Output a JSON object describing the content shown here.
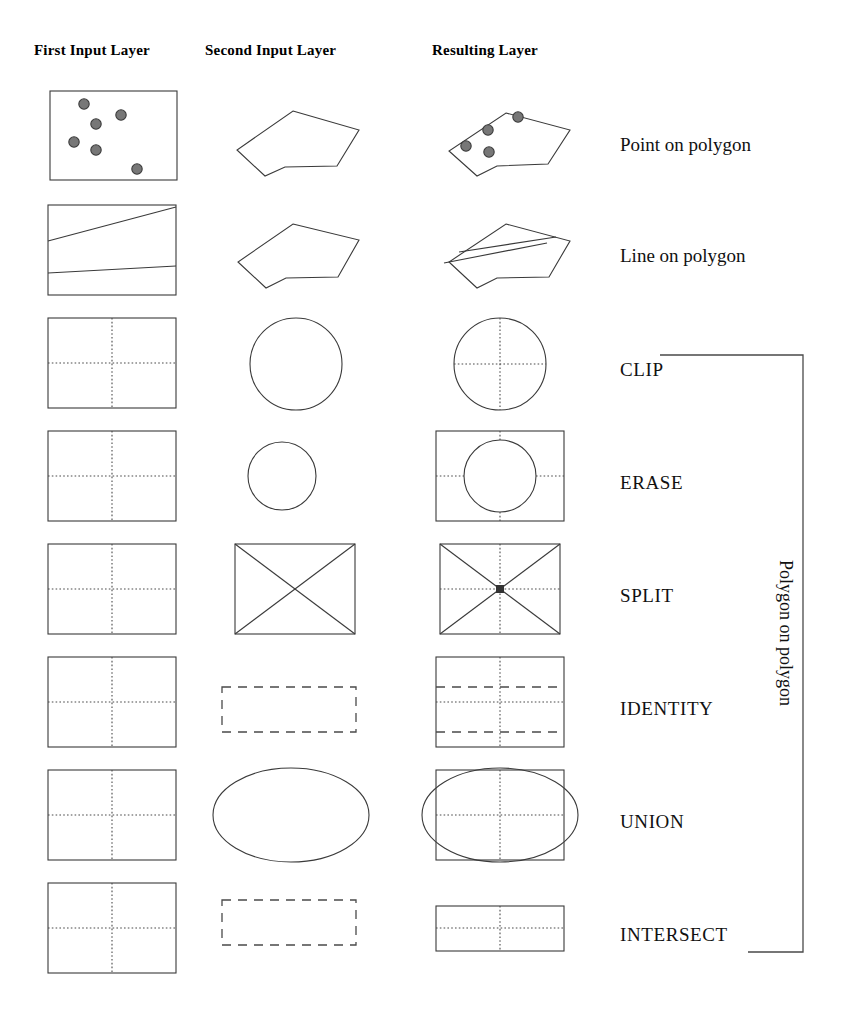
{
  "headers": {
    "first": "First Input Layer",
    "second": "Second Input Layer",
    "result": "Resulting Layer"
  },
  "bracket": {
    "label": "Polygon on polygon",
    "covers_from": "CLIP",
    "covers_to": "INTERSECT"
  },
  "rows": [
    {
      "id": "point-on-polygon",
      "label": "Point on polygon",
      "first": "rectangle with 6 scattered points",
      "second": "irregular polygon",
      "result": "polygon containing 4 points"
    },
    {
      "id": "line-on-polygon",
      "label": "Line on polygon",
      "first": "rectangle with two crossing lines",
      "second": "irregular polygon",
      "result": "polygon with crossing lines clipped to polygon"
    },
    {
      "id": "clip",
      "label": "CLIP",
      "first": "rectangle divided by dotted cross",
      "second": "circle",
      "result": "circle with dotted cross inside"
    },
    {
      "id": "erase",
      "label": "ERASE",
      "first": "rectangle divided by dotted cross",
      "second": "small circle",
      "result": "rectangle with circular hole removed"
    },
    {
      "id": "split",
      "label": "SPLIT",
      "first": "rectangle divided by dotted cross",
      "second": "rectangle with X diagonals",
      "result": "rectangle with dotted cross and X diagonals"
    },
    {
      "id": "identity",
      "label": "IDENTITY",
      "first": "rectangle divided by dotted cross",
      "second": "wide dashed rectangle",
      "result": "rectangle with dotted cross plus dashed band edges"
    },
    {
      "id": "union",
      "label": "UNION",
      "first": "rectangle divided by dotted cross",
      "second": "ellipse",
      "result": "rectangle with dotted cross overlaid by ellipse"
    },
    {
      "id": "intersect",
      "label": "INTERSECT",
      "first": "rectangle divided by dotted cross",
      "second": "wide dashed rectangle",
      "result": "short wide rectangle with dotted cross"
    }
  ],
  "colors": {
    "stroke": "#3a3a3a",
    "dotted": "#4a4a4a",
    "point_fill": "#777777",
    "text": "#111111",
    "background": "#ffffff"
  }
}
